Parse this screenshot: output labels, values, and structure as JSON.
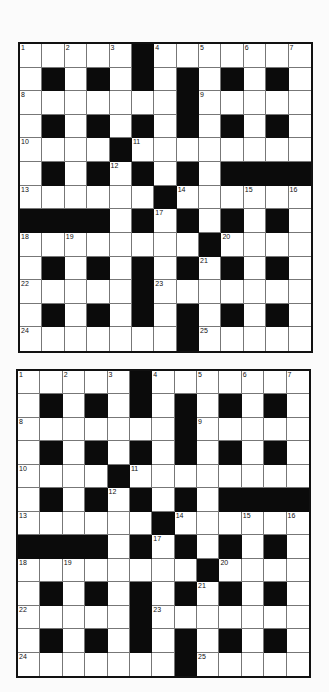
{
  "puzzle": {
    "rows": 13,
    "cols": 13,
    "pattern": [
      "WWWWWBWWWWWWW",
      "WBWBWBWBWBWBW",
      "WWWWWWWBWWWWW",
      "WBWBWBWBWBWBW",
      "WWWWBWWWWWWWW",
      "WBWBWBWBWBBBB",
      "WWWWWWBWWWWWW",
      "BBBBWBWBWBWBW",
      "WWWWWWWWBWWWW",
      "WBWBWBWBWBWBW",
      "WWWWWBWWWWWWW",
      "WBWBWBWBWBWBW",
      "WWWWWWWBWWWWW"
    ],
    "numbers": [
      {
        "r": 0,
        "c": 0,
        "n": "1"
      },
      {
        "r": 0,
        "c": 2,
        "n": "2"
      },
      {
        "r": 0,
        "c": 4,
        "n": "3"
      },
      {
        "r": 0,
        "c": 6,
        "n": "4"
      },
      {
        "r": 0,
        "c": 8,
        "n": "5"
      },
      {
        "r": 0,
        "c": 10,
        "n": "6"
      },
      {
        "r": 0,
        "c": 12,
        "n": "7"
      },
      {
        "r": 2,
        "c": 0,
        "n": "8"
      },
      {
        "r": 2,
        "c": 8,
        "n": "9"
      },
      {
        "r": 4,
        "c": 0,
        "n": "10"
      },
      {
        "r": 4,
        "c": 5,
        "n": "11"
      },
      {
        "r": 5,
        "c": 4,
        "n": "12"
      },
      {
        "r": 6,
        "c": 0,
        "n": "13"
      },
      {
        "r": 6,
        "c": 7,
        "n": "14"
      },
      {
        "r": 6,
        "c": 10,
        "n": "15"
      },
      {
        "r": 6,
        "c": 12,
        "n": "16"
      },
      {
        "r": 7,
        "c": 6,
        "n": "17"
      },
      {
        "r": 8,
        "c": 0,
        "n": "18"
      },
      {
        "r": 8,
        "c": 2,
        "n": "19"
      },
      {
        "r": 8,
        "c": 9,
        "n": "20"
      },
      {
        "r": 9,
        "c": 8,
        "n": "21"
      },
      {
        "r": 10,
        "c": 0,
        "n": "22"
      },
      {
        "r": 10,
        "c": 6,
        "n": "23"
      },
      {
        "r": 12,
        "c": 0,
        "n": "24"
      },
      {
        "r": 12,
        "c": 8,
        "n": "25"
      }
    ]
  },
  "grids": [
    {
      "id": "grid-1",
      "label": "crossword-grid-top"
    },
    {
      "id": "grid-2",
      "label": "crossword-grid-bottom"
    }
  ],
  "colors": {
    "black_cell": "#0b0b0b",
    "white_cell": "#ffffff",
    "border": "#111111",
    "background": "#fbfbfb"
  }
}
